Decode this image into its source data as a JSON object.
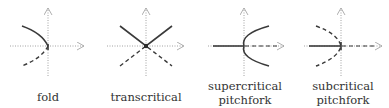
{
  "diagrams": [
    {
      "id": "fold",
      "label_lines": [
        "fold"
      ]
    },
    {
      "id": "transcritical",
      "label_lines": [
        "transcritical"
      ]
    },
    {
      "id": "supercritical",
      "label_lines": [
        "supercritical",
        "pitchfork"
      ]
    },
    {
      "id": "subcritical",
      "label_lines": [
        "subcritical",
        "pitchfork"
      ]
    }
  ],
  "legend": {
    "solid": "stable branch",
    "dashed": "unstable branch"
  },
  "colors": {
    "branch": "#3a3a3a",
    "axis": "#8a8a8a",
    "text": "#333333"
  }
}
